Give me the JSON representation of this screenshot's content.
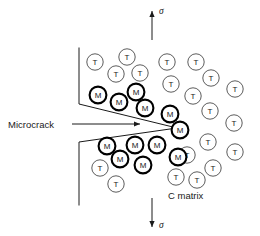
{
  "figure": {
    "background_color": "#ffffff",
    "line_color": "#1a1a1a",
    "width": 260,
    "height": 236
  },
  "labels": {
    "microcrack": "Microcrack",
    "matrix": "C matrix",
    "stress_top": "σ",
    "stress_bottom": "σ"
  },
  "annotations": {
    "microcrack_label_x": 8,
    "microcrack_label_y": 128,
    "microcrack_arrow_start_x": 72,
    "microcrack_arrow_start_y": 124,
    "microcrack_arrow_end_x": 140,
    "microcrack_arrow_end_y": 124,
    "matrix_label_x": 168,
    "matrix_label_y": 199,
    "stress_top_label_x": 159,
    "stress_top_label_y": 14,
    "stress_bottom_label_x": 159,
    "stress_bottom_label_y": 228
  },
  "stress_axis": {
    "x": 152,
    "top_arrow_tail_y": 40,
    "top_arrow_head_y": 11,
    "bottom_arrow_tail_y": 198,
    "bottom_arrow_head_y": 227
  },
  "crack_geometry": {
    "upper_boundary": "M 79,48 L 79,104 L 177,128",
    "lower_boundary": "M 177,128 L 79,142 L 79,205",
    "tip_x": 177,
    "tip_y": 128
  },
  "particle_styles": {
    "T": {
      "stroke": "#4a4a4a",
      "stroke_width": 0.9,
      "radius": 8.2,
      "fill": "#ffffff"
    },
    "M": {
      "stroke": "#000000",
      "stroke_width": 2.1,
      "radius": 8.4,
      "fill": "#ffffff"
    }
  },
  "particles": [
    {
      "label": "T",
      "type": "T",
      "cx": 95,
      "cy": 62
    },
    {
      "label": "T",
      "type": "T",
      "cx": 127,
      "cy": 57
    },
    {
      "label": "T",
      "type": "T",
      "cx": 116,
      "cy": 74
    },
    {
      "label": "T",
      "type": "T",
      "cx": 140,
      "cy": 73
    },
    {
      "label": "T",
      "type": "T",
      "cx": 167,
      "cy": 62
    },
    {
      "label": "T",
      "type": "T",
      "cx": 196,
      "cy": 62
    },
    {
      "label": "T",
      "type": "T",
      "cx": 171,
      "cy": 84
    },
    {
      "label": "T",
      "type": "T",
      "cx": 211,
      "cy": 78
    },
    {
      "label": "T",
      "type": "T",
      "cx": 235,
      "cy": 89
    },
    {
      "label": "T",
      "type": "T",
      "cx": 193,
      "cy": 96
    },
    {
      "label": "T",
      "type": "T",
      "cx": 210,
      "cy": 111
    },
    {
      "label": "T",
      "type": "T",
      "cx": 234,
      "cy": 123
    },
    {
      "label": "T",
      "type": "T",
      "cx": 208,
      "cy": 142
    },
    {
      "label": "T",
      "type": "T",
      "cx": 187,
      "cy": 155
    },
    {
      "label": "T",
      "type": "T",
      "cx": 235,
      "cy": 152
    },
    {
      "label": "T",
      "type": "T",
      "cx": 213,
      "cy": 168
    },
    {
      "label": "T",
      "type": "T",
      "cx": 176,
      "cy": 177
    },
    {
      "label": "T",
      "type": "T",
      "cx": 197,
      "cy": 180
    },
    {
      "label": "T",
      "type": "T",
      "cx": 100,
      "cy": 168
    },
    {
      "label": "T",
      "type": "T",
      "cx": 116,
      "cy": 184
    },
    {
      "label": "M",
      "type": "M",
      "cx": 98,
      "cy": 95
    },
    {
      "label": "M",
      "type": "M",
      "cx": 119,
      "cy": 102
    },
    {
      "label": "M",
      "type": "M",
      "cx": 136,
      "cy": 92
    },
    {
      "label": "M",
      "type": "M",
      "cx": 145,
      "cy": 108
    },
    {
      "label": "M",
      "type": "M",
      "cx": 170,
      "cy": 114
    },
    {
      "label": "M",
      "type": "M",
      "cx": 180,
      "cy": 130
    },
    {
      "label": "M",
      "type": "M",
      "cx": 107,
      "cy": 146
    },
    {
      "label": "M",
      "type": "M",
      "cx": 120,
      "cy": 159
    },
    {
      "label": "M",
      "type": "M",
      "cx": 135,
      "cy": 145
    },
    {
      "label": "M",
      "type": "M",
      "cx": 157,
      "cy": 145
    },
    {
      "label": "M",
      "type": "M",
      "cx": 143,
      "cy": 165
    },
    {
      "label": "M",
      "type": "M",
      "cx": 178,
      "cy": 157
    }
  ]
}
